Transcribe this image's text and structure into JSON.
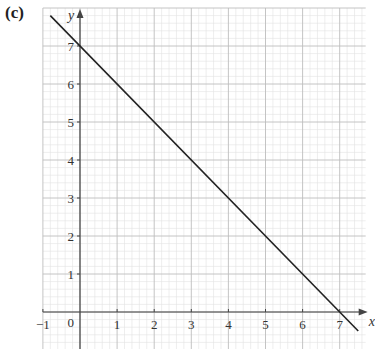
{
  "part_label": "(c)",
  "chart_data": {
    "type": "line",
    "title": "",
    "xlabel": "x",
    "ylabel": "y",
    "xlim": [
      -1,
      7.7
    ],
    "ylim": [
      -1,
      8
    ],
    "grid": true,
    "grid_minor_per_unit": 5,
    "x_ticks": [
      -1,
      0,
      1,
      2,
      3,
      4,
      5,
      6,
      7
    ],
    "y_ticks": [
      1,
      2,
      3,
      4,
      5,
      6,
      7
    ],
    "origin_label": "0",
    "series": [
      {
        "name": "y = 7 - x",
        "points": [
          [
            -0.8,
            7.8
          ],
          [
            0,
            7
          ],
          [
            7,
            0
          ],
          [
            7.5,
            -0.5
          ]
        ],
        "color": "#222222"
      }
    ]
  },
  "colors": {
    "minor_grid": "#e2e2e2",
    "major_grid": "#bdbdbd",
    "axis": "#444444",
    "line": "#222222"
  }
}
